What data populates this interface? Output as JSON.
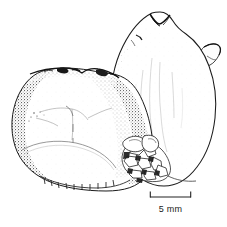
{
  "figure": {
    "medium": "stippled ink line drawing",
    "background_color": "#ffffff",
    "ink_color": "#111111",
    "width_px": 227,
    "height_px": 227
  },
  "scale_bar": {
    "label": "5 mm",
    "value": 5,
    "unit": "mm",
    "bar_left_px": 150,
    "bar_right_px": 191,
    "bar_y_px": 197,
    "tick_height_px": 6,
    "line_color": "#222222"
  },
  "specimens": [
    {
      "id": "left-specimen",
      "name": "left-specimen-lower",
      "description": "rounded oblong specimen in left foreground, heavily stippled along left and lower margins, irregular notched upper rim, faint Y-shaped suture lines across face, lobed lower portion with small marginal tick marks",
      "position": "left-foreground",
      "approx_bbox": [
        12,
        66,
        160,
        192
      ]
    },
    {
      "id": "right-specimen",
      "name": "right-specimen-upper",
      "description": "large ovate specimen behind and to the right, V-notched apex at top, small lateral lobe projecting from upper right margin, smooth pale face with faint vertical striations",
      "position": "right-background",
      "approx_bbox": [
        108,
        10,
        217,
        186
      ]
    }
  ],
  "detail_features": [
    {
      "name": "apex-notch",
      "description": "dark V-shaped notch at the top of the right specimen"
    },
    {
      "name": "lateral-lobe",
      "description": "small angular projection on the right margin of the right specimen"
    },
    {
      "name": "granular-base",
      "description": "cluster of granular cell-like polygons where the two specimens meet at the lower centre"
    },
    {
      "name": "suture-lines",
      "description": "faint branching Y-shaped lines on the face of the left specimen"
    }
  ]
}
